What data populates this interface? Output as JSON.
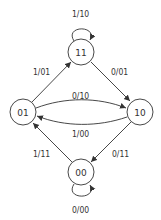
{
  "diagram": {
    "type": "state-transition-diagram",
    "states": [
      {
        "id": "11",
        "label": "11"
      },
      {
        "id": "01",
        "label": "01"
      },
      {
        "id": "10",
        "label": "10"
      },
      {
        "id": "00",
        "label": "00"
      }
    ],
    "transitions": [
      {
        "from": "11",
        "to": "11",
        "label": "1/10"
      },
      {
        "from": "01",
        "to": "11",
        "label": "1/01"
      },
      {
        "from": "11",
        "to": "10",
        "label": "0/01"
      },
      {
        "from": "01",
        "to": "10",
        "label": "0/10"
      },
      {
        "from": "10",
        "to": "01",
        "label": "1/00"
      },
      {
        "from": "00",
        "to": "01",
        "label": "1/11"
      },
      {
        "from": "10",
        "to": "00",
        "label": "0/11"
      },
      {
        "from": "00",
        "to": "00",
        "label": "0/00"
      }
    ]
  }
}
